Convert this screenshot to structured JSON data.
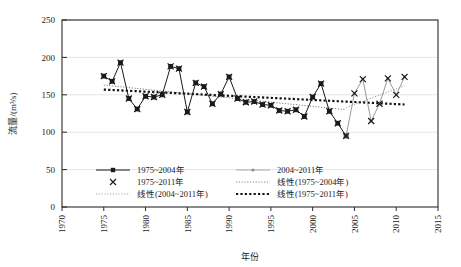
{
  "chart_data": {
    "type": "line",
    "title": "",
    "xlabel": "年份",
    "ylabel": "流量/(m³/s)",
    "xlim": [
      1970,
      2015
    ],
    "ylim": [
      0,
      250
    ],
    "xticks": [
      1970,
      1975,
      1980,
      1985,
      1990,
      1995,
      2000,
      2005,
      2010,
      2015
    ],
    "yticks": [
      0,
      50,
      100,
      150,
      200,
      250
    ],
    "grid": true,
    "grid_axis": "y",
    "legend_position": "inside-lower-left",
    "series": [
      {
        "name": "1975~2004年",
        "marker": "filled-square",
        "line_style": "solid",
        "color": "#1a1a1a",
        "x": [
          1975,
          1976,
          1977,
          1978,
          1979,
          1980,
          1981,
          1982,
          1983,
          1984,
          1985,
          1986,
          1987,
          1988,
          1989,
          1990,
          1991,
          1992,
          1993,
          1994,
          1995,
          1996,
          1997,
          1998,
          1999,
          2000,
          2001,
          2002,
          2003,
          2004
        ],
        "values": [
          175,
          168,
          193,
          145,
          131,
          148,
          147,
          150,
          188,
          185,
          127,
          166,
          161,
          138,
          151,
          174,
          145,
          140,
          141,
          137,
          136,
          129,
          128,
          130,
          121,
          147,
          165,
          128,
          112,
          95
        ]
      },
      {
        "name": "2004~2011年",
        "marker": "small-dot",
        "line_style": "solid-gray",
        "color": "#9a9a9a",
        "x": [
          2004,
          2005,
          2006,
          2007,
          2008,
          2009,
          2010,
          2011
        ],
        "values": [
          95,
          152,
          171,
          115,
          138,
          172,
          150,
          174
        ]
      },
      {
        "name": "1975~2011年",
        "marker": "x-cross",
        "line_style": "none",
        "color": "#1a1a1a",
        "x": [
          1975,
          1976,
          1977,
          1978,
          1979,
          1980,
          1981,
          1982,
          1983,
          1984,
          1985,
          1986,
          1987,
          1988,
          1989,
          1990,
          1991,
          1992,
          1993,
          1994,
          1995,
          1996,
          1997,
          1998,
          1999,
          2000,
          2001,
          2002,
          2003,
          2004,
          2005,
          2006,
          2007,
          2008,
          2009,
          2010,
          2011
        ],
        "values": [
          175,
          168,
          193,
          145,
          131,
          148,
          147,
          150,
          188,
          185,
          127,
          166,
          161,
          138,
          151,
          174,
          145,
          140,
          141,
          137,
          136,
          129,
          128,
          130,
          121,
          147,
          165,
          128,
          112,
          95,
          152,
          171,
          115,
          138,
          172,
          150,
          174
        ]
      }
    ],
    "trendlines": [
      {
        "name": "线性(1975~2004年)",
        "style": "fine-dotted",
        "color": "#7d7d7d",
        "x": [
          1975,
          2004
        ],
        "values": [
          163,
          130
        ]
      },
      {
        "name": "线性(2004~2011年)",
        "style": "fine-dotted",
        "color": "#9a9a9a",
        "x": [
          2004,
          2011
        ],
        "values": [
          133,
          162
        ]
      },
      {
        "name": "线性(1975~2011年)",
        "style": "bold-dotted",
        "color": "#111111",
        "x": [
          1975,
          2011
        ],
        "values": [
          157,
          137
        ]
      }
    ]
  },
  "legend": {
    "entries": [
      {
        "label": "1975~2004年",
        "sample": "line-filled-square"
      },
      {
        "label": "2004~2011年",
        "sample": "line-gray-dot"
      },
      {
        "label": "1975~2011年",
        "sample": "x-cross"
      },
      {
        "label": "线性(1975~2004年)",
        "sample": "fine-dotted-gray"
      },
      {
        "label": "线性(2004~2011年)",
        "sample": "fine-dotted-light"
      },
      {
        "label": "线性(1975~2011年)",
        "sample": "bold-dotted-black"
      }
    ]
  },
  "axes": {
    "y_title": "流量/(m³/s)",
    "x_title": "年份",
    "y_tick_labels": [
      "0",
      "50",
      "100",
      "150",
      "200",
      "250"
    ],
    "x_tick_labels": [
      "1970",
      "1975",
      "1980",
      "1985",
      "1990",
      "1995",
      "2000",
      "2005",
      "2010",
      "2015"
    ]
  }
}
